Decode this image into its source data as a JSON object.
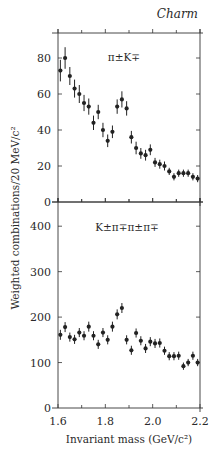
{
  "chart_data": [
    {
      "type": "scatter",
      "panel": "top",
      "title": "Charm",
      "channel_label": "π±K∓",
      "xlabel": "Invariant mass (GeV/c²)",
      "ylabel": "Weighted combinations/20 MeV/c²",
      "xlim": [
        1.6,
        2.2
      ],
      "ylim": [
        0,
        92
      ],
      "xticks": [
        1.6,
        1.7,
        1.8,
        1.9,
        2.0,
        2.1,
        2.2
      ],
      "xtick_labels": [
        "1.6",
        "",
        "1.8",
        "",
        "2.0",
        "",
        "2.2"
      ],
      "yticks": [
        0,
        20,
        40,
        60,
        80
      ],
      "ytick_labels": [
        "0",
        "20",
        "40",
        "60",
        "80"
      ],
      "grid": false,
      "x": [
        1.61,
        1.63,
        1.65,
        1.67,
        1.69,
        1.71,
        1.73,
        1.75,
        1.77,
        1.79,
        1.81,
        1.83,
        1.85,
        1.87,
        1.89,
        1.91,
        1.93,
        1.95,
        1.97,
        1.99,
        2.01,
        2.03,
        2.05,
        2.07,
        2.09,
        2.11,
        2.13,
        2.15,
        2.17,
        2.19
      ],
      "y": [
        73,
        80,
        70,
        63,
        60,
        55,
        53,
        44,
        50,
        40,
        34,
        39,
        53,
        57,
        52,
        36,
        30,
        27,
        26,
        29,
        22,
        21,
        20,
        17,
        14,
        16,
        16,
        16,
        14,
        13
      ],
      "yerr": [
        6,
        6,
        5,
        5,
        5,
        4.5,
        4.5,
        4,
        4,
        4,
        3.5,
        3.5,
        4,
        4.5,
        4,
        3.5,
        3.5,
        3,
        3,
        3,
        2.5,
        2.5,
        2.5,
        2,
        2,
        2,
        2,
        2,
        2,
        2
      ]
    },
    {
      "type": "scatter",
      "panel": "bottom",
      "channel_label": "K±π∓π±π∓",
      "xlabel": "Invariant mass (GeV/c²)",
      "ylabel": "Weighted combinations/20 MeV/c²",
      "xlim": [
        1.6,
        2.2
      ],
      "ylim": [
        0,
        430
      ],
      "xticks": [
        1.6,
        1.7,
        1.8,
        1.9,
        2.0,
        2.1,
        2.2
      ],
      "xtick_labels": [
        "1.6",
        "",
        "1.8",
        "",
        "2.0",
        "",
        "2.2"
      ],
      "yticks": [
        0,
        100,
        200,
        300,
        400
      ],
      "ytick_labels": [
        "0",
        "100",
        "200",
        "300",
        "400"
      ],
      "grid": false,
      "x": [
        1.61,
        1.63,
        1.65,
        1.67,
        1.69,
        1.71,
        1.73,
        1.75,
        1.77,
        1.79,
        1.81,
        1.83,
        1.85,
        1.87,
        1.89,
        1.91,
        1.93,
        1.95,
        1.97,
        1.99,
        2.01,
        2.03,
        2.05,
        2.07,
        2.09,
        2.11,
        2.13,
        2.15,
        2.17,
        2.19
      ],
      "y": [
        161,
        178,
        156,
        151,
        166,
        159,
        179,
        159,
        140,
        166,
        150,
        179,
        206,
        220,
        150,
        127,
        165,
        148,
        131,
        146,
        142,
        143,
        126,
        114,
        114,
        115,
        92,
        100,
        115,
        100
      ],
      "yerr": [
        11,
        11,
        10,
        10,
        10,
        10,
        11,
        10,
        10,
        10,
        10,
        11,
        11,
        11,
        10,
        10,
        10,
        10,
        10,
        10,
        10,
        10,
        9,
        9,
        9,
        9,
        8,
        8,
        9,
        8
      ]
    }
  ]
}
